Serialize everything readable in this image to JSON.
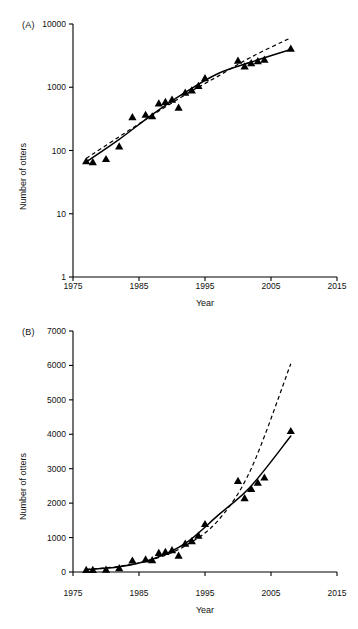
{
  "figure": {
    "panels": [
      {
        "label": "(A)",
        "axis": {
          "xlabel": "Year",
          "ylabel": "Number of otters",
          "x_ticks": [
            "1975",
            "1985",
            "1995",
            "2005",
            "2015"
          ],
          "y_ticks": [
            "1",
            "10",
            "100",
            "1000",
            "10000"
          ]
        }
      },
      {
        "label": "(B)",
        "axis": {
          "xlabel": "Year",
          "ylabel": "Number of otters",
          "x_ticks": [
            "1975",
            "1985",
            "1995",
            "2005",
            "2015"
          ],
          "y_ticks": [
            "0",
            "1000",
            "2000",
            "3000",
            "4000",
            "5000",
            "6000",
            "7000"
          ]
        }
      }
    ]
  },
  "chart_data": [
    {
      "type": "scatter",
      "panel": "(A)",
      "title": "",
      "xlabel": "Year",
      "ylabel": "Number of otters",
      "yscale": "log",
      "xscale": "linear",
      "xlim": [
        1975,
        2015
      ],
      "ylim": [
        1,
        10000
      ],
      "xticks": [
        1975,
        1985,
        1995,
        2005,
        2015
      ],
      "yticks": [
        1,
        10,
        100,
        1000,
        10000
      ],
      "grid": false,
      "legend": false,
      "series": [
        {
          "name": "Observed counts",
          "marker": "triangle",
          "color": "#000000",
          "x": [
            1977,
            1978,
            1980,
            1982,
            1984,
            1986,
            1987,
            1988,
            1989,
            1990,
            1991,
            1992,
            1993,
            1994,
            1995,
            2000,
            2001,
            2002,
            2003,
            2004,
            2008
          ],
          "y": [
            68,
            66,
            74,
            117,
            340,
            370,
            350,
            560,
            590,
            640,
            480,
            830,
            900,
            1060,
            1400,
            2650,
            2150,
            2420,
            2600,
            2750,
            4100
          ]
        },
        {
          "name": "Fitted trend (solid)",
          "style": "solid",
          "color": "#000000",
          "x": [
            1977,
            1982,
            1987,
            1992,
            1997,
            2002,
            2008
          ],
          "y": [
            66,
            150,
            370,
            830,
            1650,
            2500,
            3950
          ]
        },
        {
          "name": "Exponential model (dashed)",
          "style": "dashed",
          "color": "#000000",
          "x": [
            1977,
            1982,
            1987,
            1992,
            1997,
            2002,
            2008
          ],
          "y": [
            75,
            165,
            360,
            760,
            1500,
            3000,
            6050
          ]
        }
      ]
    },
    {
      "type": "scatter",
      "panel": "(B)",
      "title": "",
      "xlabel": "Year",
      "ylabel": "Number of otters",
      "yscale": "linear",
      "xscale": "linear",
      "xlim": [
        1975,
        2015
      ],
      "ylim": [
        0,
        7000
      ],
      "xticks": [
        1975,
        1985,
        1995,
        2005,
        2015
      ],
      "yticks": [
        0,
        1000,
        2000,
        3000,
        4000,
        5000,
        6000,
        7000
      ],
      "grid": false,
      "legend": false,
      "series": [
        {
          "name": "Observed counts",
          "marker": "triangle",
          "color": "#000000",
          "x": [
            1977,
            1978,
            1980,
            1982,
            1984,
            1986,
            1987,
            1988,
            1989,
            1990,
            1991,
            1992,
            1993,
            1994,
            1995,
            2000,
            2001,
            2002,
            2003,
            2004,
            2008
          ],
          "y": [
            68,
            66,
            74,
            117,
            340,
            370,
            350,
            560,
            590,
            640,
            480,
            830,
            900,
            1060,
            1400,
            2650,
            2150,
            2420,
            2600,
            2750,
            4100
          ]
        },
        {
          "name": "Fitted trend (solid)",
          "style": "solid",
          "color": "#000000",
          "x": [
            1977,
            1982,
            1987,
            1992,
            1997,
            2002,
            2008
          ],
          "y": [
            66,
            150,
            370,
            830,
            1650,
            2500,
            3950
          ]
        },
        {
          "name": "Exponential model (dashed)",
          "style": "dashed",
          "color": "#000000",
          "x": [
            1977,
            1982,
            1987,
            1992,
            1997,
            2002,
            2008
          ],
          "y": [
            75,
            165,
            360,
            760,
            1500,
            3000,
            6050
          ]
        }
      ]
    }
  ]
}
